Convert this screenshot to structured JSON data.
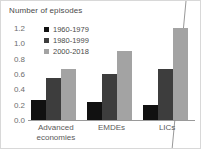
{
  "chart_data": {
    "type": "bar",
    "title": "Number of episodes",
    "xlabel": "",
    "ylabel": "",
    "ylim": [
      0.0,
      1.2
    ],
    "yticks": [
      "0.0",
      "0.2",
      "0.4",
      "0.6",
      "0.8",
      "1.0",
      "1.2"
    ],
    "ytick_values": [
      0.0,
      0.2,
      0.4,
      0.6,
      0.8,
      1.0,
      1.2
    ],
    "grid": false,
    "legend_position": "upper-left-inside",
    "categories": [
      "Advanced economies",
      "EMDEs",
      "LICs"
    ],
    "series": [
      {
        "name": "1960-1979",
        "color": "#111111",
        "values": [
          0.26,
          0.24,
          0.2
        ]
      },
      {
        "name": "1980-1999",
        "color": "#3d3d3d",
        "values": [
          0.55,
          0.6,
          0.67
        ]
      },
      {
        "name": "2000-2018",
        "color": "#a3a3a3",
        "values": [
          0.66,
          0.9,
          1.2
        ]
      }
    ],
    "annotations": [
      "diagonal-line-overlay"
    ]
  },
  "axis": {
    "baseline_color": "#9a9a9a"
  }
}
